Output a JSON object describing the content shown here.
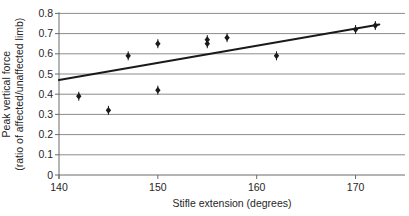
{
  "chart_data": {
    "type": "scatter",
    "title": "",
    "xlabel": "Stifle extension (degrees)",
    "ylabel_line1": "Peak vertical force",
    "ylabel_line2": "(ratio of affected/unaffected limb)",
    "xlim": [
      140,
      175
    ],
    "ylim": [
      0,
      0.8
    ],
    "x_ticks": [
      140,
      150,
      160,
      170
    ],
    "y_ticks": [
      0,
      0.1,
      0.2,
      0.3,
      0.4,
      0.5,
      0.6,
      0.7,
      0.8
    ],
    "grid": "horizontal",
    "legend": "none",
    "points": [
      {
        "x": 142,
        "y": 0.39
      },
      {
        "x": 145,
        "y": 0.32
      },
      {
        "x": 147,
        "y": 0.59
      },
      {
        "x": 150,
        "y": 0.65
      },
      {
        "x": 150,
        "y": 0.42
      },
      {
        "x": 155,
        "y": 0.67
      },
      {
        "x": 155,
        "y": 0.65
      },
      {
        "x": 157,
        "y": 0.68
      },
      {
        "x": 162,
        "y": 0.59
      },
      {
        "x": 170,
        "y": 0.72
      },
      {
        "x": 172,
        "y": 0.74
      }
    ],
    "trendline": {
      "x1": 140,
      "y1": 0.47,
      "x2": 172.4,
      "y2": 0.745
    },
    "colors": {
      "marker": "#1a1a1a",
      "trendline": "#1a1a1a",
      "gridline": "#8c8c8c",
      "axis": "#6b6b6b",
      "text": "#262626",
      "background": "#ffffff"
    }
  }
}
